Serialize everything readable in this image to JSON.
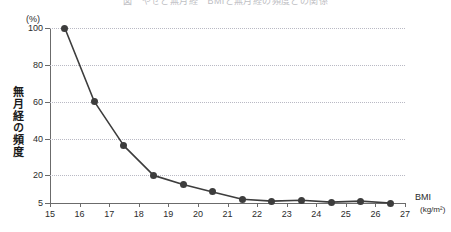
{
  "chart_data": {
    "type": "line",
    "title": "図　やせと無月経　BMIと無月経の頻度との関係",
    "xlabel": "BMI",
    "xunit": "(kg/m²)",
    "ylabel": "無月経の頻度",
    "yunit": "(%)",
    "xlim": [
      15,
      27
    ],
    "ylim": [
      5,
      100
    ],
    "grid": true,
    "legend": "none",
    "marker": "filled-circle",
    "line_color": "#3d3d3d",
    "marker_color": "#3d3d3d",
    "grid_color": "#b9b9c4",
    "axis_color": "#6b6b6b",
    "x_ticks": [
      15,
      16,
      17,
      18,
      19,
      20,
      21,
      22,
      23,
      24,
      25,
      26,
      27
    ],
    "y_ticks": [
      5,
      20,
      40,
      60,
      80,
      100
    ],
    "x": [
      15.5,
      16.5,
      17.5,
      18.5,
      19.5,
      20.5,
      21.5,
      22.5,
      23.5,
      24.5,
      25.5,
      26.5
    ],
    "values": [
      100,
      60,
      36,
      20,
      15,
      11,
      7,
      6,
      6.5,
      5.5,
      6,
      5
    ],
    "categories": [
      "15.5",
      "16.5",
      "17.5",
      "18.5",
      "19.5",
      "20.5",
      "21.5",
      "22.5",
      "23.5",
      "24.5",
      "25.5",
      "26.5"
    ]
  }
}
